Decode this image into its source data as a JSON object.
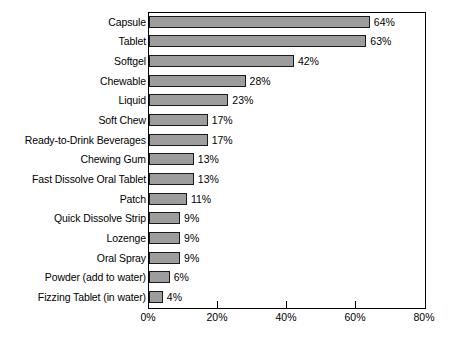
{
  "chart_data": {
    "type": "bar",
    "orientation": "horizontal",
    "title": "",
    "subtitle": "",
    "xlabel": "",
    "ylabel": "",
    "xlim": [
      0,
      80
    ],
    "xticks": [
      0,
      20,
      40,
      60,
      80
    ],
    "xtick_labels": [
      "0%",
      "20%",
      "40%",
      "60%",
      "80%"
    ],
    "grid": false,
    "legend": null,
    "value_suffix": "%",
    "bar_fill_color": "#9d9d9d",
    "bar_border_color": "#1a1a1a",
    "axis_color": "#000000",
    "background_color": "#ffffff",
    "categories": [
      "Capsule",
      "Tablet",
      "Softgel",
      "Chewable",
      "Liquid",
      "Soft Chew",
      "Ready-to-Drink Beverages",
      "Chewing Gum",
      "Fast Dissolve Oral Tablet",
      "Patch",
      "Quick Dissolve Strip",
      "Lozenge",
      "Oral Spray",
      "Powder (add to water)",
      "Fizzing Tablet (in water)"
    ],
    "values": [
      64,
      63,
      42,
      28,
      23,
      17,
      17,
      13,
      13,
      11,
      9,
      9,
      9,
      6,
      4
    ],
    "value_labels": [
      "64%",
      "63%",
      "42%",
      "28%",
      "23%",
      "17%",
      "17%",
      "13%",
      "13%",
      "11%",
      "9%",
      "9%",
      "9%",
      "6%",
      "4%"
    ]
  }
}
